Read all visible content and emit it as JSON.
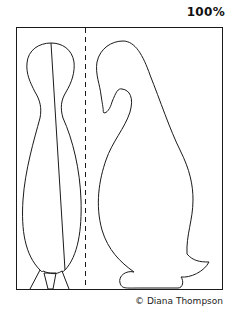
{
  "scale_label": "100%",
  "credit": "© Diana Thompson",
  "pattern": {
    "description": "Penguin sewing/cut-out template: front body piece (left) and side body piece (right) separated by a dashed fold line",
    "pieces": [
      "front-piece",
      "side-piece"
    ],
    "fold_line": "dashed"
  },
  "colors": {
    "stroke": "#1a1a1a",
    "background": "#ffffff"
  }
}
